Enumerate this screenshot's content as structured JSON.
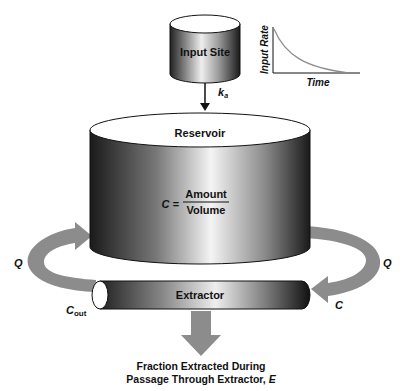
{
  "input_site": {
    "label": "Input Site"
  },
  "rate_constant": {
    "symbol": "k",
    "subscript": "a"
  },
  "inset_chart": {
    "ylabel": "Input Rate",
    "xlabel": "Time"
  },
  "reservoir": {
    "label": "Reservoir",
    "equation_lhs": "C =",
    "numerator": "Amount",
    "denominator": "Volume"
  },
  "flow": {
    "left_label": "Q",
    "right_label": "Q"
  },
  "extractor": {
    "label": "Extractor",
    "inlet_label": "C",
    "outlet_symbol": "C",
    "outlet_subscript": "out"
  },
  "output": {
    "line1": "Fraction Extracted During",
    "line2_prefix": "Passage Through Extractor, ",
    "line2_symbol": "E"
  },
  "colors": {
    "arrow": "#8c8c8c",
    "cyl_dark": "#1a1a1a",
    "cyl_light": "#f2f2f2"
  }
}
